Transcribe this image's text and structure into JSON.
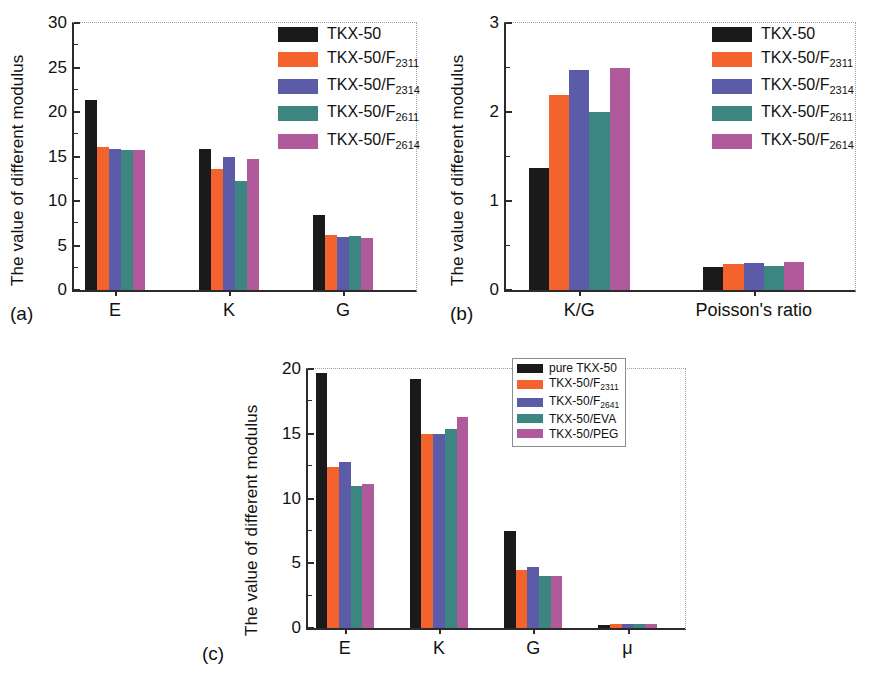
{
  "figure": {
    "background": "#ffffff",
    "series_colors": {
      "black": "#1a1a1a",
      "orange": "#f4632e",
      "blue": "#5b5ba8",
      "teal": "#3d8580",
      "magenta": "#b05a9c"
    }
  },
  "panels": [
    {
      "tag": "(a)",
      "ylabel": "The value of different modulus",
      "legend_position": "top-right",
      "legend_boxed": false
    },
    {
      "tag": "(b)",
      "ylabel": "The value of different modulus",
      "legend_position": "top-right",
      "legend_boxed": false
    },
    {
      "tag": "(c)",
      "ylabel": "The value of different modulus",
      "legend_position": "top-right",
      "legend_boxed": true
    }
  ],
  "chart_data": [
    {
      "type": "bar",
      "panel": "a",
      "title": "",
      "xlabel": "",
      "ylabel": "The value of different modulus",
      "categories": [
        "E",
        "K",
        "G"
      ],
      "ylim": [
        0,
        30
      ],
      "yticks": [
        0,
        5,
        10,
        15,
        20,
        25,
        30
      ],
      "ytick_labels": [
        "0",
        "5",
        "10",
        "15",
        "20",
        "25",
        "30"
      ],
      "grid": false,
      "legend": "top-right",
      "series": [
        {
          "name": "TKX-50",
          "color": "#1a1a1a",
          "values": [
            21.3,
            15.8,
            8.4
          ]
        },
        {
          "name": "TKX-50/F_2311",
          "color": "#f4632e",
          "values": [
            16.1,
            13.6,
            6.2
          ]
        },
        {
          "name": "TKX-50/F_2314",
          "color": "#5b5ba8",
          "values": [
            15.8,
            14.9,
            6.0
          ]
        },
        {
          "name": "TKX-50/F_2611",
          "color": "#3d8580",
          "values": [
            15.7,
            12.2,
            6.1
          ]
        },
        {
          "name": "TKX-50/F_2614",
          "color": "#b05a9c",
          "values": [
            15.7,
            14.7,
            5.9
          ]
        }
      ],
      "legend_entries": [
        {
          "base": "TKX-50",
          "sub": ""
        },
        {
          "base": "TKX-50/F",
          "sub": "2311"
        },
        {
          "base": "TKX-50/F",
          "sub": "2314"
        },
        {
          "base": "TKX-50/F",
          "sub": "2611"
        },
        {
          "base": "TKX-50/F",
          "sub": "2614"
        }
      ]
    },
    {
      "type": "bar",
      "panel": "b",
      "title": "",
      "xlabel": "",
      "ylabel": "The value of different modulus",
      "categories": [
        "K/G",
        "Poisson's ratio"
      ],
      "ylim": [
        0,
        3
      ],
      "yticks": [
        0,
        1,
        2,
        3
      ],
      "ytick_labels": [
        "0",
        "1",
        "2",
        "3"
      ],
      "grid": false,
      "legend": "top-right",
      "series": [
        {
          "name": "TKX-50",
          "color": "#1a1a1a",
          "values": [
            1.37,
            0.26
          ]
        },
        {
          "name": "TKX-50/F_2311",
          "color": "#f4632e",
          "values": [
            2.19,
            0.29
          ]
        },
        {
          "name": "TKX-50/F_2314",
          "color": "#5b5ba8",
          "values": [
            2.47,
            0.3
          ]
        },
        {
          "name": "TKX-50/F_2611",
          "color": "#3d8580",
          "values": [
            2.0,
            0.27
          ]
        },
        {
          "name": "TKX-50/F_2614",
          "color": "#b05a9c",
          "values": [
            2.49,
            0.31
          ]
        }
      ],
      "legend_entries": [
        {
          "base": "TKX-50",
          "sub": ""
        },
        {
          "base": "TKX-50/F",
          "sub": "2311"
        },
        {
          "base": "TKX-50/F",
          "sub": "2314"
        },
        {
          "base": "TKX-50/F",
          "sub": "2611"
        },
        {
          "base": "TKX-50/F",
          "sub": "2614"
        }
      ]
    },
    {
      "type": "bar",
      "panel": "c",
      "title": "",
      "xlabel": "",
      "ylabel": "The value of different modulus",
      "categories": [
        "E",
        "K",
        "G",
        "μ"
      ],
      "ylim": [
        0,
        20
      ],
      "yticks": [
        0,
        5,
        10,
        15,
        20
      ],
      "ytick_labels": [
        "0",
        "5",
        "10",
        "15",
        "20"
      ],
      "grid": false,
      "legend": "top-right",
      "series": [
        {
          "name": "pure TKX-50",
          "color": "#1a1a1a",
          "values": [
            19.7,
            19.2,
            7.5,
            0.25
          ]
        },
        {
          "name": "TKX-50/F_2311",
          "color": "#f4632e",
          "values": [
            12.4,
            15.0,
            4.5,
            0.3
          ]
        },
        {
          "name": "TKX-50/F_2641",
          "color": "#5b5ba8",
          "values": [
            12.8,
            15.0,
            4.7,
            0.32
          ]
        },
        {
          "name": "TKX-50/EVA",
          "color": "#3d8580",
          "values": [
            11.0,
            15.4,
            4.0,
            0.31
          ]
        },
        {
          "name": "TKX-50/PEG",
          "color": "#b05a9c",
          "values": [
            11.1,
            16.3,
            4.0,
            0.31
          ]
        }
      ],
      "legend_entries": [
        {
          "base": "pure TKX-50",
          "sub": ""
        },
        {
          "base": "TKX-50/F",
          "sub": "2311"
        },
        {
          "base": "TKX-50/F",
          "sub": "2641"
        },
        {
          "base": "TKX-50/EVA",
          "sub": ""
        },
        {
          "base": "TKX-50/PEG",
          "sub": ""
        }
      ]
    }
  ]
}
